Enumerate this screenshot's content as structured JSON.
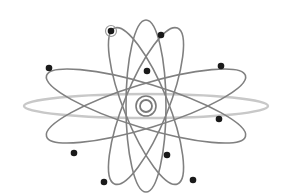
{
  "diagram": {
    "type": "atom-model",
    "background": "#ffffff",
    "nucleus": {
      "cx": 146,
      "cy": 106,
      "r": 6,
      "color": "#7a7a7a"
    },
    "colors": {
      "orbit_dark": "#808080",
      "orbit_light": "#c8c8c8",
      "electron": "#1a1a1a",
      "halo": "#9a9a9a"
    },
    "orbits": [
      {
        "id": "horizontal-light",
        "rx": 122,
        "ry": 12,
        "rotate": 0,
        "shade": "light"
      },
      {
        "id": "vertical",
        "rx": 20,
        "ry": 86,
        "rotate": 0,
        "shade": "dark"
      },
      {
        "id": "tilt-left",
        "rx": 22,
        "ry": 84,
        "rotate": -22,
        "shade": "dark"
      },
      {
        "id": "tilt-right",
        "rx": 22,
        "ry": 84,
        "rotate": 22,
        "shade": "dark"
      },
      {
        "id": "wide-up",
        "rx": 104,
        "ry": 22,
        "rotate": -17,
        "shade": "dark"
      },
      {
        "id": "wide-down",
        "rx": 104,
        "ry": 22,
        "rotate": 17,
        "shade": "dark"
      }
    ],
    "electrons": [
      {
        "x": 111,
        "y": 31,
        "halo": true
      },
      {
        "x": 161,
        "y": 35
      },
      {
        "x": 147,
        "y": 71
      },
      {
        "x": 49,
        "y": 68
      },
      {
        "x": 221,
        "y": 66
      },
      {
        "x": 219,
        "y": 119
      },
      {
        "x": 74,
        "y": 153
      },
      {
        "x": 167,
        "y": 155
      },
      {
        "x": 104,
        "y": 182
      },
      {
        "x": 193,
        "y": 180
      }
    ]
  }
}
